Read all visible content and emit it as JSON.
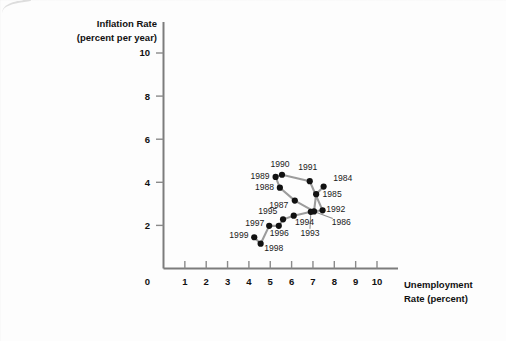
{
  "chart_data": {
    "type": "scatter",
    "title": "",
    "xlabel": "Unemployment Rate (percent)",
    "ylabel": "Inflation Rate (percent per year)",
    "xlabel_line1": "Unemployment",
    "xlabel_line2": "Rate (percent)",
    "ylabel_line1": "Inflation Rate",
    "ylabel_line2": "(percent per year)",
    "xlim": [
      0,
      10.6
    ],
    "ylim": [
      0,
      11.2
    ],
    "xticks": [
      0,
      1,
      2,
      3,
      4,
      5,
      6,
      7,
      8,
      9,
      10
    ],
    "xtick_labels": [
      "0",
      "1",
      "2",
      "3",
      "4",
      "5",
      "6",
      "7",
      "8",
      "9",
      "10"
    ],
    "yticks": [
      2,
      4,
      6,
      8,
      10
    ],
    "ytick_labels": [
      "2",
      "4",
      "6",
      "8",
      "10"
    ],
    "grid": false,
    "legend": "none",
    "connected": true,
    "line_color": "#9c9c9c",
    "marker_color": "#111111",
    "axis_color": "#7c7c7c",
    "points": [
      {
        "label": "1984",
        "x": 7.5,
        "y": 3.8,
        "lx": 7.95,
        "ly": 4.05,
        "anchor": "start",
        "leader": false
      },
      {
        "label": "1985",
        "x": 7.15,
        "y": 3.45,
        "lx": 7.45,
        "ly": 3.3,
        "anchor": "start",
        "leader": false
      },
      {
        "label": "1986",
        "x": 7.05,
        "y": 2.65,
        "lx": 7.88,
        "ly": 2.0,
        "anchor": "start",
        "leader": true
      },
      {
        "label": "1987",
        "x": 6.15,
        "y": 3.15,
        "lx": 5.85,
        "ly": 2.82,
        "anchor": "end",
        "leader": false
      },
      {
        "label": "1988",
        "x": 5.45,
        "y": 3.75,
        "lx": 5.18,
        "ly": 3.63,
        "anchor": "end",
        "leader": false
      },
      {
        "label": "1989",
        "x": 5.25,
        "y": 4.25,
        "lx": 4.97,
        "ly": 4.13,
        "anchor": "end",
        "leader": false
      },
      {
        "label": "1990",
        "x": 5.55,
        "y": 4.35,
        "lx": 5.46,
        "ly": 4.72,
        "anchor": "middle",
        "leader": false
      },
      {
        "label": "1991",
        "x": 6.85,
        "y": 4.05,
        "lx": 6.76,
        "ly": 4.55,
        "anchor": "middle",
        "leader": false
      },
      {
        "label": "1992",
        "x": 7.45,
        "y": 2.7,
        "lx": 7.62,
        "ly": 2.62,
        "anchor": "start",
        "leader": false
      },
      {
        "label": "1993",
        "x": 6.9,
        "y": 2.63,
        "lx": 6.86,
        "ly": 1.52,
        "anchor": "middle",
        "leader": true
      },
      {
        "label": "1994",
        "x": 6.1,
        "y": 2.45,
        "lx": 6.16,
        "ly": 2.0,
        "anchor": "start",
        "leader": false
      },
      {
        "label": "1995",
        "x": 5.6,
        "y": 2.28,
        "lx": 5.33,
        "ly": 2.52,
        "anchor": "end",
        "leader": false
      },
      {
        "label": "1996",
        "x": 5.4,
        "y": 1.98,
        "lx": 5.42,
        "ly": 1.53,
        "anchor": "middle",
        "leader": false
      },
      {
        "label": "1997",
        "x": 4.95,
        "y": 1.98,
        "lx": 4.72,
        "ly": 1.98,
        "anchor": "end",
        "leader": false
      },
      {
        "label": "1998",
        "x": 4.55,
        "y": 1.15,
        "lx": 4.72,
        "ly": 0.82,
        "anchor": "start",
        "leader": false
      },
      {
        "label": "1999",
        "x": 4.25,
        "y": 1.45,
        "lx": 3.98,
        "ly": 1.42,
        "anchor": "end",
        "leader": false
      }
    ],
    "path_order": [
      "1984",
      "1985",
      "1986",
      "1987",
      "1988",
      "1989",
      "1990",
      "1991",
      "1992",
      "1993",
      "1994",
      "1995",
      "1996",
      "1997",
      "1998",
      "1999"
    ]
  }
}
